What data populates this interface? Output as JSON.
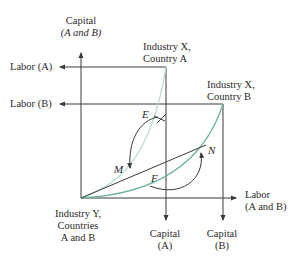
{
  "diagram": {
    "type": "edgeworth-box-trade",
    "labels": {
      "capital_ab_top": [
        "Capital",
        "(A and B)"
      ],
      "labor_a": "Labor (A)",
      "labor_b": "Labor (B)",
      "industry_x_a": [
        "Industry X,",
        "Country A"
      ],
      "industry_x_b": [
        "Industry X,",
        "Country B"
      ],
      "industry_y": [
        "Industry Y,",
        "Countries",
        "A and B"
      ],
      "capital_a_bottom": [
        "Capital",
        "(A)"
      ],
      "capital_b_bottom": [
        "Capital",
        "(B)"
      ],
      "labor_ab_right": [
        "Labor",
        "(A and B)"
      ]
    },
    "points": {
      "E": "E",
      "M": "M",
      "F": "F",
      "N": "N"
    },
    "colors": {
      "axis": "#3a3a3a",
      "curve_a": "#b9dcd2",
      "curve_b": "#6fb39e",
      "text": "#2b2b2b"
    }
  }
}
